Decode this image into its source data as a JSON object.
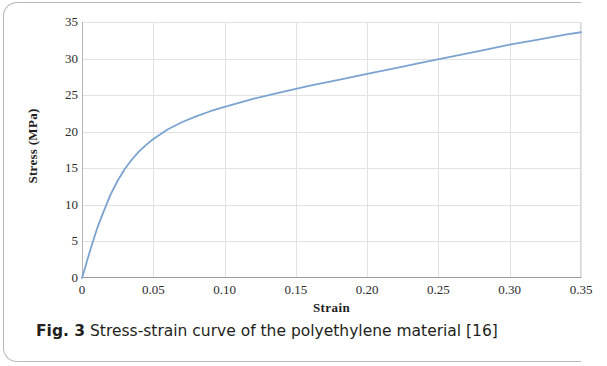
{
  "figure": {
    "caption_label": "Fig. 3",
    "caption_text": "Stress-strain curve of the polyethylene material [16]"
  },
  "colors": {
    "curve": "#7ba3d0",
    "grid": "#e2e2e2",
    "axis": "#9b9b9b",
    "text": "#231f20"
  },
  "chart_data": {
    "type": "line",
    "title": "",
    "xlabel": "Strain",
    "ylabel": "Stress (MPa)",
    "xlim": [
      0,
      0.35
    ],
    "ylim": [
      0,
      35
    ],
    "xticks": [
      0,
      0.05,
      0.1,
      0.15,
      0.2,
      0.25,
      0.3,
      0.35
    ],
    "xtick_labels": [
      "0",
      "0.05",
      "0.10",
      "0.15",
      "0.20",
      "0.25",
      "0.30",
      "0.35"
    ],
    "yticks": [
      0,
      5,
      10,
      15,
      20,
      25,
      30,
      35
    ],
    "ytick_labels": [
      "0",
      "5",
      "10",
      "15",
      "20",
      "25",
      "30",
      "35"
    ],
    "grid": true,
    "legend": "none",
    "series": [
      {
        "name": "Polyethylene stress-strain",
        "color": "#7ba3d0",
        "x": [
          0,
          0.002,
          0.005,
          0.008,
          0.011,
          0.015,
          0.02,
          0.025,
          0.03,
          0.035,
          0.04,
          0.045,
          0.05,
          0.06,
          0.07,
          0.08,
          0.09,
          0.1,
          0.12,
          0.14,
          0.16,
          0.18,
          0.2,
          0.22,
          0.24,
          0.26,
          0.28,
          0.3,
          0.32,
          0.34,
          0.35
        ],
        "y": [
          0,
          1.3,
          3.3,
          5.2,
          7.0,
          9.0,
          11.4,
          13.3,
          14.9,
          16.2,
          17.3,
          18.2,
          19.0,
          20.3,
          21.3,
          22.1,
          22.8,
          23.4,
          24.5,
          25.4,
          26.3,
          27.1,
          27.9,
          28.7,
          29.5,
          30.3,
          31.1,
          31.9,
          32.6,
          33.3,
          33.6
        ]
      }
    ]
  }
}
